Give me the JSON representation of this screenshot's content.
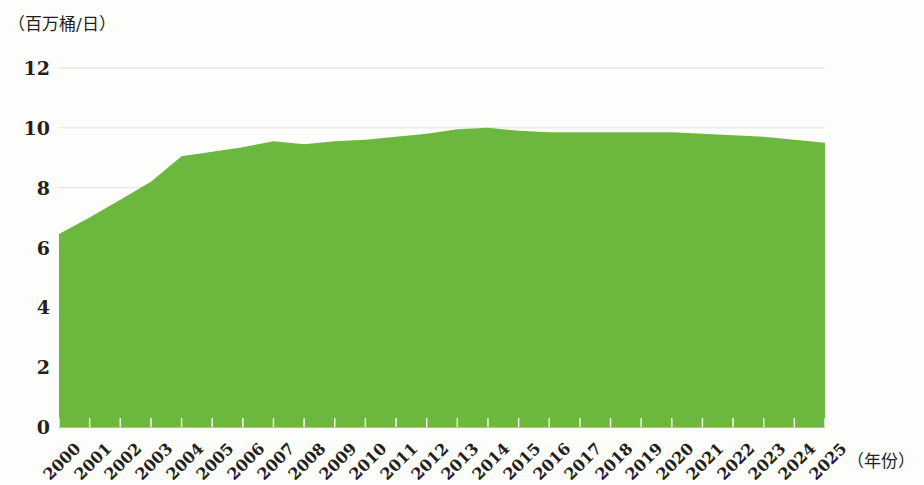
{
  "chart_data": {
    "type": "area",
    "title": "",
    "subtitle": "",
    "ylabel": "（百万桶/日）",
    "xlabel": "（年份）",
    "ylim": [
      0,
      12
    ],
    "ytick_labels": [
      "0",
      "2",
      "4",
      "6",
      "8",
      "10",
      "12"
    ],
    "ytick_values": [
      0,
      2,
      4,
      6,
      8,
      10,
      12
    ],
    "grid": true,
    "grid_axis": "y",
    "legend": null,
    "legend_position": "none",
    "categories": [
      "2000",
      "2001",
      "2002",
      "2003",
      "2004",
      "2005",
      "2006",
      "2007",
      "2008",
      "2009",
      "2010",
      "2011",
      "2012",
      "2013",
      "2014",
      "2015",
      "2016",
      "2017",
      "2018",
      "2019",
      "2020",
      "2021",
      "2022",
      "2023",
      "2024",
      "2025"
    ],
    "values": [
      6.45,
      7.0,
      7.6,
      8.2,
      9.05,
      9.2,
      9.35,
      9.55,
      9.45,
      9.55,
      9.6,
      9.7,
      9.8,
      9.95,
      10.0,
      9.9,
      9.85,
      9.85,
      9.85,
      9.85,
      9.85,
      9.8,
      9.75,
      9.7,
      9.6,
      9.5
    ],
    "series_name": "产量",
    "series_color": "#6cb83f"
  },
  "style": {
    "area_color": "#6cb83f",
    "grid_color": "#e2e2de",
    "axis_color": "#b9b9b4",
    "text_color": "#231f1c",
    "background": "#fdfdfb"
  }
}
